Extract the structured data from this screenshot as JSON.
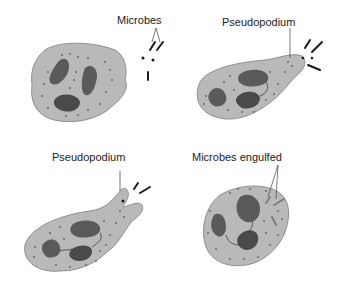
{
  "colors": {
    "cytoplasm": "#b9b9b9",
    "cytoplasm_edge": "#8f8f8f",
    "nucleus": "#5a5a5a",
    "nucleus_dark": "#3e3e3e",
    "granule": "#6a6a6a",
    "microbe": "#1a1a1a",
    "leader": "#444444"
  },
  "panels": [
    {
      "id": "panel-1",
      "label": "Microbes"
    },
    {
      "id": "panel-2",
      "label": "Pseudopodium"
    },
    {
      "id": "panel-3",
      "label": "Pseudopodium"
    },
    {
      "id": "panel-4",
      "label": "Microbes engulfed"
    }
  ]
}
